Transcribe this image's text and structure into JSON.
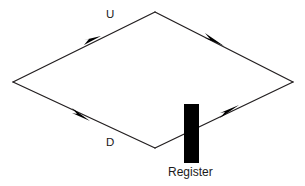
{
  "diagram": {
    "title": "",
    "background_color": "#ffffff",
    "line_color": "#231f20",
    "fill_color": "#000000",
    "text_color": "#1a1a1a",
    "labels": {
      "up_path": "U",
      "down_path": "D",
      "register": "Register"
    },
    "nodes": [
      {
        "name": "top-vertex",
        "x": 155,
        "y": 12
      },
      {
        "name": "left-vertex",
        "x": 13,
        "y": 82
      },
      {
        "name": "right-vertex",
        "x": 293,
        "y": 82
      },
      {
        "name": "bottom-vertex",
        "x": 155,
        "y": 148
      }
    ],
    "edges": [
      {
        "name": "edge-left-to-top",
        "from": "left-vertex",
        "to": "top-vertex",
        "arrow_at": {
          "x": 95,
          "y": 41
        }
      },
      {
        "name": "edge-top-to-right",
        "from": "top-vertex",
        "to": "right-vertex",
        "arrow_at": {
          "x": 220,
          "y": 44
        }
      },
      {
        "name": "edge-left-to-bottom",
        "from": "left-vertex",
        "to": "bottom-vertex",
        "arrow_at": {
          "x": 86,
          "y": 117
        }
      },
      {
        "name": "edge-bottom-to-right",
        "from": "bottom-vertex",
        "to": "right-vertex",
        "arrow_at": {
          "x": 236,
          "y": 108
        }
      }
    ],
    "register_block": {
      "x": 184,
      "y": 104,
      "width": 15,
      "height": 59
    }
  }
}
